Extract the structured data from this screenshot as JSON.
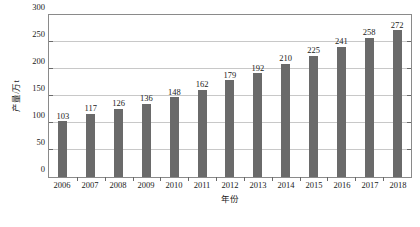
{
  "chart_data": {
    "type": "bar",
    "title": "",
    "subtitle": "",
    "xlabel": "年份",
    "ylabel": "产量/万t",
    "categories": [
      "2006",
      "2007",
      "2008",
      "2009",
      "2010",
      "2011",
      "2012",
      "2013",
      "2014",
      "2015",
      "2016",
      "2017",
      "2018"
    ],
    "values": [
      103,
      117,
      126,
      136,
      148,
      162,
      179,
      192,
      210,
      225,
      241,
      258,
      272
    ],
    "series": [
      {
        "name": "产量",
        "values": [
          103,
          117,
          126,
          136,
          148,
          162,
          179,
          192,
          210,
          225,
          241,
          258,
          272
        ]
      }
    ],
    "data_labels": [
      "103",
      "117",
      "126",
      "136",
      "148",
      "162",
      "179",
      "192",
      "210",
      "225",
      "241",
      "258",
      "272"
    ],
    "ylim": [
      0,
      300
    ],
    "yticks": [
      0,
      50,
      100,
      150,
      200,
      250,
      300
    ],
    "ytick_labels": [
      "0",
      "50",
      "100",
      "150",
      "200",
      "250",
      "300"
    ],
    "xtick_labels": [
      "2006",
      "2007",
      "2008",
      "2009",
      "2010",
      "2011",
      "2012",
      "2013",
      "2014",
      "2015",
      "2016",
      "2017",
      "2018"
    ],
    "grid": true,
    "grid_axis": "y",
    "legend": false,
    "legend_position": "none",
    "bar_color": "#6a6a6a",
    "gridline_color": "#c8c8c8",
    "axis_color": "#8a8a8a",
    "text_color": "#1a1a1a",
    "background": "#ffffff"
  }
}
